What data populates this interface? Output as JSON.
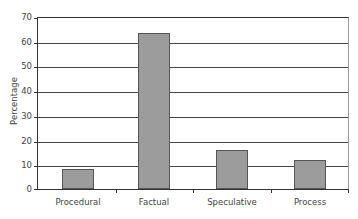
{
  "chart_data": {
    "type": "bar",
    "title": "",
    "xlabel": "",
    "ylabel": "Percentage",
    "categories": [
      "Procedural",
      "Factual",
      "Speculative",
      "Process"
    ],
    "values": [
      8,
      64,
      16,
      12
    ],
    "ylim": [
      0,
      70
    ],
    "yticks": [
      "0",
      "10",
      "20",
      "30",
      "40",
      "50",
      "60",
      "70"
    ],
    "grid": true,
    "legend": null,
    "bar_color": "#9c9c9c",
    "bar_edge_color": "#555555"
  }
}
